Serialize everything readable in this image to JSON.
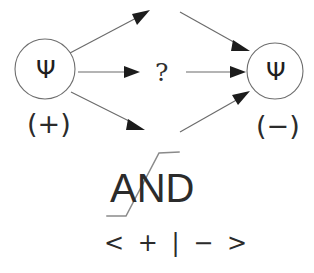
{
  "figure": {
    "type": "quantum-state-transition-diagram",
    "background_color": "#ffffff",
    "line_color": "#6b6b6b",
    "arrowhead_color": "#1c1c1c",
    "text_color": "#2b2b2b",
    "circle_stroke_color": "#6e6e6e"
  },
  "nodes": {
    "left": {
      "symbol": "Ψ",
      "label": "(+)",
      "cx": 45,
      "cy": 69,
      "r": 30
    },
    "right": {
      "symbol": "Ψ",
      "label": "(−)",
      "cx": 275,
      "cy": 71,
      "r": 28
    }
  },
  "center": {
    "question_mark": "?"
  },
  "annotations": {
    "and_label": "AND",
    "and_struck_through": true,
    "braket": "< + | − >"
  },
  "arrows": [
    {
      "name": "left-up-outgoing",
      "from": [
        72,
        52
      ],
      "to": [
        146,
        12
      ]
    },
    {
      "name": "left-mid-outgoing",
      "from": [
        78,
        72
      ],
      "to": [
        137,
        72
      ]
    },
    {
      "name": "left-down-outgoing",
      "from": [
        72,
        92
      ],
      "to": [
        142,
        128
      ]
    },
    {
      "name": "right-up-incoming",
      "from": [
        182,
        12
      ],
      "to": [
        248,
        50
      ]
    },
    {
      "name": "right-mid-incoming",
      "from": [
        185,
        72
      ],
      "to": [
        244,
        72
      ]
    },
    {
      "name": "right-down-incoming",
      "from": [
        180,
        132
      ],
      "to": [
        246,
        93
      ]
    }
  ]
}
